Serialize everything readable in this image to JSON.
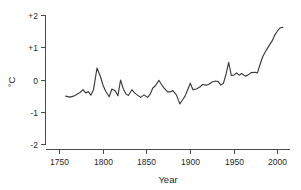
{
  "chart_data": {
    "type": "line",
    "title": "",
    "xlabel": "Year",
    "ylabel": "°C",
    "xlim": [
      1740,
      2015
    ],
    "ylim": [
      -2,
      2
    ],
    "grid": false,
    "legend": null,
    "xticks": [
      1750,
      1800,
      1850,
      1900,
      1950,
      2000
    ],
    "xtick_labels": [
      "1750",
      "1800",
      "1850",
      "1900",
      "1950",
      "2000"
    ],
    "yticks": [
      -2,
      -1,
      0,
      1,
      2
    ],
    "ytick_labels": [
      "-2",
      "-1",
      "0",
      "+1",
      "+2"
    ],
    "series": [
      {
        "name": "temperature anomaly",
        "color": "#3b3b3b",
        "x": [
          1757,
          1762,
          1766,
          1770,
          1774,
          1777,
          1780,
          1783,
          1786,
          1789,
          1793,
          1797,
          1800,
          1803,
          1807,
          1810,
          1814,
          1817,
          1820,
          1823,
          1826,
          1829,
          1833,
          1836,
          1839,
          1843,
          1847,
          1851,
          1854,
          1857,
          1860,
          1864,
          1867,
          1870,
          1874,
          1877,
          1880,
          1884,
          1888,
          1891,
          1894,
          1897,
          1900,
          1903,
          1907,
          1911,
          1914,
          1918,
          1921,
          1925,
          1929,
          1932,
          1935,
          1938,
          1941,
          1944,
          1947,
          1950,
          1953,
          1956,
          1959,
          1963,
          1966,
          1970,
          1974,
          1977,
          1980,
          1983,
          1987,
          1990,
          1994,
          1997,
          2000,
          2003,
          2006
        ],
        "y": [
          -0.5,
          -0.53,
          -0.5,
          -0.44,
          -0.38,
          -0.3,
          -0.4,
          -0.36,
          -0.47,
          -0.3,
          0.37,
          0.1,
          -0.17,
          -0.35,
          -0.52,
          -0.28,
          -0.34,
          -0.49,
          0.0,
          -0.26,
          -0.43,
          -0.48,
          -0.3,
          -0.4,
          -0.46,
          -0.54,
          -0.46,
          -0.54,
          -0.44,
          -0.25,
          -0.18,
          -0.01,
          -0.14,
          -0.25,
          -0.37,
          -0.37,
          -0.33,
          -0.46,
          -0.74,
          -0.62,
          -0.5,
          -0.3,
          -0.1,
          -0.3,
          -0.28,
          -0.22,
          -0.14,
          -0.16,
          -0.14,
          -0.06,
          -0.03,
          -0.05,
          -0.16,
          -0.1,
          0.18,
          0.55,
          0.14,
          0.15,
          0.22,
          0.15,
          0.2,
          0.12,
          0.15,
          0.23,
          0.24,
          0.22,
          0.48,
          0.72,
          0.92,
          1.05,
          1.22,
          1.4,
          1.52,
          1.62,
          1.63
        ],
        "y_min": -0.74,
        "y_max": 1.63
      }
    ]
  },
  "axes": {
    "y_axis_label": "°C",
    "x_axis_label": "Year"
  }
}
